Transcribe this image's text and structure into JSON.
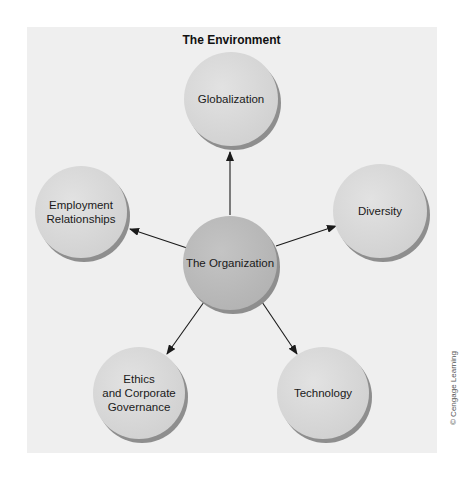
{
  "diagram": {
    "title": "The Environment",
    "center_node": {
      "id": "organization",
      "label": "The Organization",
      "cx": 230,
      "cy": 263,
      "r": 47,
      "fill": "#b8b8b8"
    },
    "nodes": [
      {
        "id": "globalization",
        "label": "Globalization",
        "cx": 231,
        "cy": 99,
        "r": 47,
        "fill": "#d6d6d6"
      },
      {
        "id": "employment-relationships",
        "label": "Employment\nRelationships",
        "cx": 81,
        "cy": 212,
        "r": 46,
        "fill": "#d6d6d6"
      },
      {
        "id": "diversity",
        "label": "Diversity",
        "cx": 380,
        "cy": 211,
        "r": 47,
        "fill": "#d6d6d6"
      },
      {
        "id": "ethics-corporate-governance",
        "label": "Ethics\nand Corporate\nGovernance",
        "cx": 139,
        "cy": 393,
        "r": 46,
        "fill": "#d6d6d6"
      },
      {
        "id": "technology",
        "label": "Technology",
        "cx": 323,
        "cy": 393,
        "r": 46,
        "fill": "#d6d6d6"
      }
    ],
    "edges": [
      {
        "from": "organization",
        "to": "globalization",
        "x1": 230,
        "y1": 215,
        "x2": 230,
        "y2": 152
      },
      {
        "from": "organization",
        "to": "employment-relationships",
        "x1": 187,
        "y1": 248,
        "x2": 130,
        "y2": 229
      },
      {
        "from": "organization",
        "to": "diversity",
        "x1": 276,
        "y1": 246,
        "x2": 336,
        "y2": 226
      },
      {
        "from": "organization",
        "to": "ethics-corporate-governance",
        "x1": 204,
        "y1": 302,
        "x2": 167,
        "y2": 354
      },
      {
        "from": "organization",
        "to": "technology",
        "x1": 262,
        "y1": 302,
        "x2": 297,
        "y2": 354
      }
    ],
    "colors": {
      "panel_background": "#efefef",
      "outer_node_fill": "#d6d6d6",
      "center_node_fill": "#b8b8b8",
      "node_shadow": "#8e8e8e",
      "arrow": "#1a1a1a"
    }
  },
  "credit": "© Cengage Learning"
}
